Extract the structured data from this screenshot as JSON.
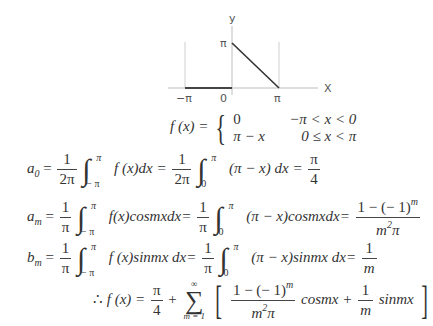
{
  "graph": {
    "y_axis_label": "y",
    "x_axis_label": "X",
    "y_tick_label": "π",
    "x_tick_labels": [
      "−π",
      "0",
      "π"
    ],
    "function_segments": [
      {
        "from": [
          -3.14159,
          0
        ],
        "to": [
          0,
          0
        ]
      },
      {
        "from": [
          0,
          3.14159
        ],
        "to": [
          3.14159,
          0
        ]
      }
    ]
  },
  "definition": {
    "lhs": "f (x) =",
    "case1_value": "0",
    "case1_condition": "−π < x < 0",
    "case2_value": "π − x",
    "case2_condition": "0 ≤ x < π"
  },
  "a0": {
    "lhs": "a",
    "lhs_sub": "0",
    "frac1_num": "1",
    "frac1_den": "2π",
    "int1_upper": "π",
    "int1_lower": "− π",
    "integrand1": "f (x)dx =",
    "frac2_num": "1",
    "frac2_den": "2π",
    "int2_upper": "π",
    "int2_lower": "0",
    "integrand2": "(π − x) dx =",
    "result_num": "π",
    "result_den": "4"
  },
  "am": {
    "lhs": "a",
    "lhs_sub": "m",
    "frac1_num": "1",
    "frac1_den": "π",
    "int1_upper": "π",
    "int1_lower": "− π",
    "integrand1": "f(x)cosmxdx=",
    "frac2_num": "1",
    "frac2_den": "π",
    "int2_upper": "π",
    "int2_lower": "0",
    "integrand2": "(π − x)cosmxdx=",
    "result_num": "1 − (− 1)",
    "result_num_sup": "m",
    "result_den": "m",
    "result_den_sup": "2",
    "result_den_tail": "π"
  },
  "bm": {
    "lhs": "b",
    "lhs_sub": "m",
    "frac1_num": "1",
    "frac1_den": "π",
    "int1_upper": "π",
    "int1_lower": "− π",
    "integrand1": "f (x)sinmx dx=",
    "frac2_num": "1",
    "frac2_den": "π",
    "int2_upper": "π",
    "int2_lower": "0",
    "integrand2": "(π − x)sinmx dx=",
    "result_num": "1",
    "result_den": "m"
  },
  "series": {
    "therefore": "∴",
    "lhs": "f (x) =",
    "const_num": "π",
    "const_den": "4",
    "plus": "+",
    "sum_upper": "∞",
    "sum_symbol": "∑",
    "sum_lower": "m = 1",
    "t1_num": "1 − (− 1)",
    "t1_num_sup": "m",
    "t1_den": "m",
    "t1_den_sup": "2",
    "t1_den_tail": "π",
    "t1_func": "cosmx +",
    "t2_num": "1",
    "t2_den": "m",
    "t2_func": "sinmx"
  }
}
